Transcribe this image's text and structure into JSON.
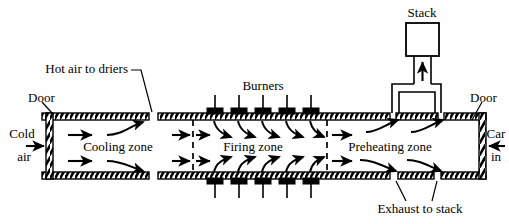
{
  "figure": {
    "type": "process-flow-diagram",
    "background_color": "#ffffff",
    "line_color": "#000000"
  },
  "labels": {
    "stack": "Stack",
    "burners": "Burners",
    "hot_air_to_driers": "Hot air to driers",
    "door_left": "Door",
    "door_right": "Door",
    "cold_air_line1": "Cold",
    "cold_air_line2": "air",
    "car_in_line1": "Car",
    "car_in_line2": "in",
    "exhaust_to_stack": "Exhaust to stack",
    "zone_cooling": "Cooling zone",
    "zone_firing": "Firing zone",
    "zone_preheating": "Preheating zone"
  },
  "zones": [
    {
      "name": "Cooling zone",
      "order": 1,
      "x_start": 40,
      "x_end": 168
    },
    {
      "name": "Firing zone",
      "order": 2,
      "x_start": 168,
      "x_end": 322
    },
    {
      "name": "Preheating zone",
      "order": 3,
      "x_start": 322,
      "x_end": 452
    }
  ],
  "components": {
    "burner_count_top": 5,
    "burner_count_bottom": 5,
    "burner_top_x": [
      215,
      239,
      263,
      287,
      311
    ],
    "burner_bottom_x": [
      215,
      239,
      263,
      287,
      311
    ],
    "doors": [
      {
        "side": "left",
        "label": "Door"
      },
      {
        "side": "right",
        "label": "Door"
      }
    ],
    "stack": {
      "label": "Stack",
      "flow_direction": "up"
    },
    "openings": [
      {
        "label": "Hot air to driers",
        "position": "top-left"
      },
      {
        "label": "Exhaust to stack",
        "position": "bottom-right"
      }
    ]
  },
  "flows": [
    {
      "label": "Cold air",
      "direction": "right",
      "entry": "left-door"
    },
    {
      "label": "Car in",
      "direction": "left",
      "entry": "right-door"
    },
    {
      "label": "Exhaust to stack",
      "direction": "up",
      "exit": "stack"
    }
  ]
}
